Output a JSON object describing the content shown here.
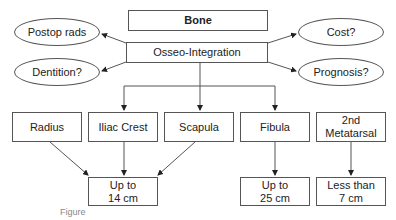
{
  "diagram": {
    "root": {
      "label": "Bone"
    },
    "hub": {
      "label": "Osseo-Integration"
    },
    "considerations": [
      {
        "label": "Postop rads"
      },
      {
        "label": "Dentition?"
      },
      {
        "label": "Cost?"
      },
      {
        "label": "Prognosis?"
      }
    ],
    "donor_sites": [
      {
        "label": "Radius"
      },
      {
        "label": "Iliac Crest"
      },
      {
        "label": "Scapula"
      },
      {
        "label": "Fibula"
      },
      {
        "label": "2nd Metatarsal"
      }
    ],
    "lengths": [
      {
        "line1": "Up to",
        "line2": "14 cm"
      },
      {
        "line1": "Up to",
        "line2": "25 cm"
      },
      {
        "line1": "Less than",
        "line2": "7 cm"
      }
    ],
    "caption": "Figure"
  }
}
